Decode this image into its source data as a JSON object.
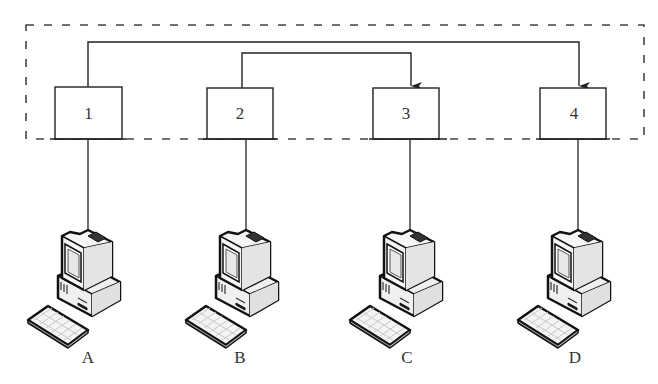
{
  "diagram": {
    "type": "network-connection-diagram",
    "colors": {
      "stroke": "#333333",
      "background": "#ffffff",
      "computer_fill": "#f2f2f2",
      "computer_screen": "#e6e6e6"
    },
    "group_boundary": {
      "style": "dashed",
      "contains": [
        "1",
        "2",
        "3",
        "4"
      ]
    },
    "nodes": [
      {
        "id": "1",
        "label": "1",
        "connected_computer": "A"
      },
      {
        "id": "2",
        "label": "2",
        "connected_computer": "B"
      },
      {
        "id": "3",
        "label": "3",
        "connected_computer": "C"
      },
      {
        "id": "4",
        "label": "4",
        "connected_computer": "D"
      }
    ],
    "computers": [
      {
        "id": "A",
        "label": "A",
        "icon": "desktop-computer-icon"
      },
      {
        "id": "B",
        "label": "B",
        "icon": "desktop-computer-icon"
      },
      {
        "id": "C",
        "label": "C",
        "icon": "desktop-computer-icon"
      },
      {
        "id": "D",
        "label": "D",
        "icon": "desktop-computer-icon"
      }
    ],
    "edges": [
      {
        "from": "1",
        "to": "4",
        "directed": true
      },
      {
        "from": "2",
        "to": "3",
        "directed": true
      },
      {
        "from": "1",
        "to": "A",
        "directed": false
      },
      {
        "from": "2",
        "to": "B",
        "directed": false
      },
      {
        "from": "3",
        "to": "C",
        "directed": false
      },
      {
        "from": "4",
        "to": "D",
        "directed": false
      }
    ]
  }
}
